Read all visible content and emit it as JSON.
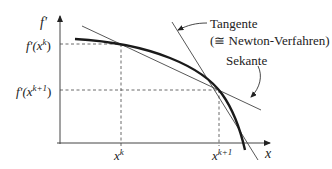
{
  "diagram": {
    "y_axis_label": "f'",
    "x_axis_label": "x",
    "y_tick_labels": [
      {
        "base": "f'(x",
        "sup": "k",
        "close": ")"
      },
      {
        "base": "f'(x",
        "sup": "k+1",
        "close": ")"
      }
    ],
    "x_tick_labels": [
      {
        "base": "x",
        "sup": "k"
      },
      {
        "base": "x",
        "sup": "k+1"
      }
    ],
    "annotations": {
      "tangent_label": "Tangente",
      "tangent_sublabel": "(≅  Newton-Verfahren)",
      "secant_label": "Sekante"
    },
    "colors": {
      "curve": "#1a1a1a",
      "lines": "#333333",
      "dashed": "#444444"
    }
  }
}
